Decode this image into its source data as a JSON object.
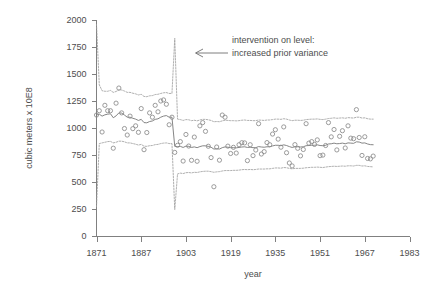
{
  "chart_data": {
    "type": "line",
    "title": "",
    "subtitle": "",
    "xlabel": "year",
    "ylabel": "cubic meters x 10E8",
    "xlim": [
      1871,
      1983
    ],
    "ylim": [
      0,
      2000
    ],
    "grid": false,
    "legend_position": "none",
    "x_ticks": [
      1871,
      1887,
      1903,
      1919,
      1935,
      1951,
      1967,
      1983
    ],
    "x_tick_labels": [
      "1871",
      "1887",
      "1903",
      "1919",
      "1935",
      "1951",
      "1967",
      "1983"
    ],
    "y_ticks": [
      0,
      250,
      500,
      750,
      1000,
      1250,
      1500,
      1750,
      2000
    ],
    "y_tick_labels": [
      "0",
      "250",
      "500",
      "750",
      "1000",
      "1250",
      "1500",
      "1750",
      "2000"
    ],
    "annotations": [
      {
        "name": "intervention-annotation",
        "lines": [
          "intervention on level:",
          "increased prior variance"
        ],
        "x": 1899,
        "arrow": true,
        "arrow_direction": "left"
      }
    ],
    "intervention_year": 1899,
    "x": [
      1871,
      1872,
      1873,
      1874,
      1875,
      1876,
      1877,
      1878,
      1879,
      1880,
      1881,
      1882,
      1883,
      1884,
      1885,
      1886,
      1887,
      1888,
      1889,
      1890,
      1891,
      1892,
      1893,
      1894,
      1895,
      1896,
      1897,
      1898,
      1899,
      1900,
      1901,
      1902,
      1903,
      1904,
      1905,
      1906,
      1907,
      1908,
      1909,
      1910,
      1911,
      1912,
      1913,
      1914,
      1915,
      1916,
      1917,
      1918,
      1919,
      1920,
      1921,
      1922,
      1923,
      1924,
      1925,
      1926,
      1927,
      1928,
      1929,
      1930,
      1931,
      1932,
      1933,
      1934,
      1935,
      1936,
      1937,
      1938,
      1939,
      1940,
      1941,
      1942,
      1943,
      1944,
      1945,
      1946,
      1947,
      1948,
      1949,
      1950,
      1951,
      1952,
      1953,
      1954,
      1955,
      1956,
      1957,
      1958,
      1959,
      1960,
      1961,
      1962,
      1963,
      1964,
      1965,
      1966,
      1967,
      1968,
      1969,
      1970
    ],
    "series": [
      {
        "name": "observations",
        "style": "open-circles",
        "values": [
          1120,
          1160,
          963,
          1210,
          1160,
          1160,
          813,
          1230,
          1370,
          1140,
          995,
          935,
          1110,
          994,
          1020,
          960,
          1180,
          799,
          958,
          1140,
          1100,
          1210,
          1150,
          1250,
          1260,
          1220,
          1030,
          1100,
          774,
          840,
          874,
          694,
          940,
          833,
          701,
          916,
          692,
          1020,
          1050,
          969,
          831,
          726,
          456,
          824,
          702,
          1120,
          1100,
          832,
          764,
          821,
          768,
          845,
          864,
          862,
          698,
          845,
          744,
          796,
          1040,
          759,
          781,
          865,
          845,
          944,
          984,
          897,
          822,
          1010,
          771,
          676,
          649,
          846,
          812,
          742,
          801,
          1040,
          860,
          874,
          848,
          890,
          744,
          749,
          838,
          1050,
          918,
          986,
          797,
          923,
          975,
          815,
          1020,
          906,
          901,
          1170,
          912,
          746,
          919,
          718,
          714,
          740
        ]
      },
      {
        "name": "filtered-level",
        "style": "solid-line",
        "values": [
          1120,
          1128,
          1110,
          1122,
          1128,
          1132,
          1095,
          1112,
          1140,
          1138,
          1120,
          1100,
          1100,
          1090,
          1082,
          1070,
          1080,
          1050,
          1048,
          1060,
          1065,
          1080,
          1085,
          1100,
          1110,
          1115,
          1100,
          1100,
          830,
          828,
          830,
          820,
          832,
          830,
          820,
          825,
          818,
          828,
          835,
          835,
          830,
          822,
          805,
          808,
          805,
          818,
          825,
          822,
          818,
          818,
          816,
          820,
          824,
          826,
          820,
          822,
          818,
          818,
          828,
          824,
          822,
          826,
          826,
          834,
          840,
          840,
          836,
          844,
          838,
          828,
          820,
          826,
          826,
          824,
          826,
          836,
          838,
          840,
          840,
          844,
          838,
          836,
          840,
          852,
          854,
          860,
          854,
          856,
          860,
          854,
          862,
          860,
          858,
          872,
          870,
          860,
          862,
          852,
          846,
          845
        ]
      },
      {
        "name": "upper-bound",
        "style": "dotted-line",
        "values": [
          1960,
          1400,
          1345,
          1340,
          1340,
          1348,
          1330,
          1338,
          1352,
          1352,
          1342,
          1330,
          1330,
          1322,
          1316,
          1306,
          1312,
          1292,
          1290,
          1298,
          1300,
          1310,
          1312,
          1320,
          1326,
          1328,
          1320,
          1320,
          1830,
          1082,
          1078,
          1070,
          1078,
          1076,
          1068,
          1072,
          1066,
          1074,
          1080,
          1080,
          1076,
          1070,
          1058,
          1060,
          1058,
          1066,
          1072,
          1070,
          1068,
          1068,
          1066,
          1068,
          1072,
          1074,
          1070,
          1070,
          1068,
          1068,
          1074,
          1072,
          1070,
          1074,
          1074,
          1078,
          1082,
          1082,
          1080,
          1086,
          1082,
          1074,
          1068,
          1072,
          1072,
          1070,
          1072,
          1078,
          1080,
          1082,
          1082,
          1084,
          1080,
          1078,
          1082,
          1088,
          1090,
          1094,
          1090,
          1092,
          1094,
          1090,
          1096,
          1094,
          1092,
          1100,
          1100,
          1092,
          1094,
          1086,
          1082,
          1082
        ]
      },
      {
        "name": "lower-bound",
        "style": "dotted-line",
        "values": [
          270,
          856,
          862,
          868,
          874,
          876,
          862,
          868,
          878,
          878,
          872,
          862,
          862,
          856,
          850,
          842,
          848,
          832,
          830,
          836,
          838,
          846,
          848,
          856,
          860,
          862,
          856,
          856,
          245,
          575,
          582,
          578,
          586,
          588,
          584,
          590,
          588,
          594,
          598,
          600,
          600,
          596,
          590,
          594,
          596,
          602,
          606,
          606,
          606,
          608,
          608,
          610,
          614,
          616,
          614,
          616,
          614,
          616,
          620,
          620,
          620,
          622,
          622,
          626,
          630,
          630,
          628,
          634,
          632,
          626,
          622,
          626,
          626,
          626,
          628,
          632,
          634,
          636,
          636,
          638,
          636,
          634,
          638,
          642,
          644,
          646,
          644,
          646,
          648,
          646,
          650,
          650,
          648,
          654,
          654,
          648,
          650,
          644,
          642,
          640
        ]
      }
    ]
  }
}
